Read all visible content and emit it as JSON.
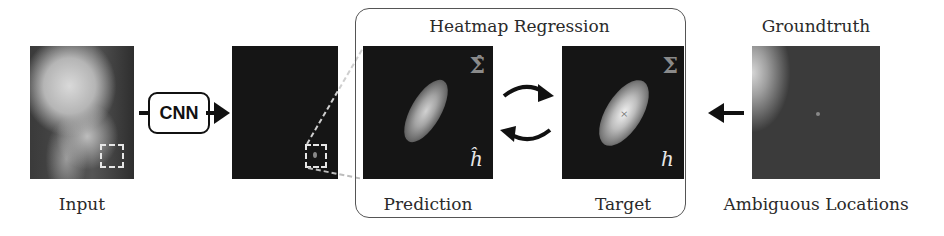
{
  "figure": {
    "input": {
      "label": "Input"
    },
    "cnn": {
      "label": "CNN"
    },
    "heatmap_regression": {
      "title": "Heatmap Regression",
      "prediction": {
        "label": "Prediction",
        "sigma_symbol": "Σ̂",
        "h_symbol": "ĥ"
      },
      "target": {
        "label": "Target",
        "sigma_symbol": "Σ",
        "h_symbol": "h"
      }
    },
    "groundtruth": {
      "title": "Groundtruth",
      "label": "Ambiguous Locations"
    }
  },
  "icons": {
    "right-arrow": "arrow-right",
    "cycle-arrows": "circular-arrows",
    "left-arrow": "arrow-left"
  }
}
